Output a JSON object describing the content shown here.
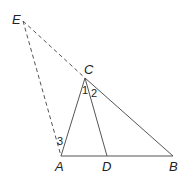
{
  "diagram": {
    "points": {
      "E": {
        "label": "E",
        "x": 23,
        "y": 21,
        "lx": 12,
        "ly": 24
      },
      "C": {
        "label": "C",
        "x": 85,
        "y": 78,
        "lx": 84,
        "ly": 74
      },
      "A": {
        "label": "A",
        "x": 61,
        "y": 156,
        "lx": 55,
        "ly": 171
      },
      "D": {
        "label": "D",
        "x": 107,
        "y": 156,
        "lx": 102,
        "ly": 171
      },
      "B": {
        "label": "B",
        "x": 173,
        "y": 156,
        "lx": 169,
        "ly": 171
      }
    },
    "segments_solid": [
      [
        "A",
        "C"
      ],
      [
        "C",
        "B"
      ],
      [
        "A",
        "B"
      ],
      [
        "C",
        "D"
      ]
    ],
    "segments_dashed": [
      [
        "E",
        "C"
      ],
      [
        "E",
        "A"
      ]
    ],
    "angle_labels": [
      {
        "label": "1",
        "x": 82,
        "y": 94
      },
      {
        "label": "2",
        "x": 91,
        "y": 97
      },
      {
        "label": "3",
        "x": 57,
        "y": 145
      }
    ]
  }
}
